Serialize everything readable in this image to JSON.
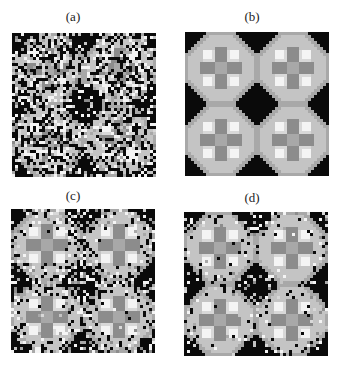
{
  "figure": {
    "panels": [
      {
        "id": "a",
        "label": "(a)",
        "mode": "noise",
        "noise": 0.55,
        "x": 12,
        "y": 33,
        "size": 144,
        "label_x": 53,
        "label_y": 10
      },
      {
        "id": "b",
        "label": "(b)",
        "mode": "clean",
        "noise": 0.0,
        "x": 185,
        "y": 32,
        "size": 144,
        "label_x": 232,
        "label_y": 10
      },
      {
        "id": "c",
        "label": "(c)",
        "mode": "partial",
        "noise": 0.38,
        "x": 11,
        "y": 209,
        "size": 144,
        "label_x": 53,
        "label_y": 189
      },
      {
        "id": "d",
        "label": "(d)",
        "mode": "partial",
        "noise": 0.18,
        "x": 184,
        "y": 212,
        "size": 144,
        "label_x": 232,
        "label_y": 191
      }
    ],
    "grid_cells": 48,
    "palette": {
      "black": "#0a0a0a",
      "dark": "#8c8c8c",
      "mid": "#a8a8a8",
      "light": "#c4c4c4",
      "pale": "#d8d8d8",
      "white": "#f4f4f4"
    }
  }
}
